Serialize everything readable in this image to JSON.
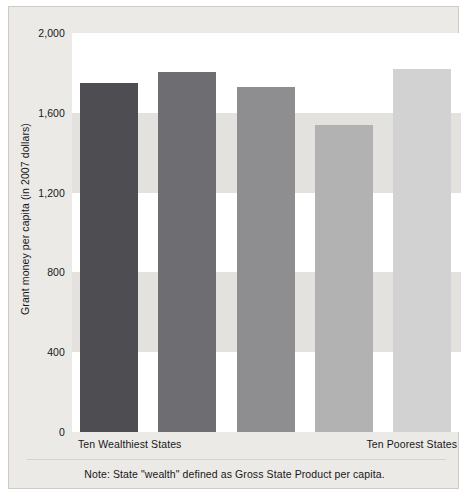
{
  "chart_data": {
    "type": "bar",
    "title": "",
    "xlabel": "",
    "ylabel": "Grant money per capita (in 2007 dollars)",
    "ylim": [
      0,
      2000
    ],
    "yticks": [
      2000,
      1600,
      1200,
      800,
      400,
      0
    ],
    "ytick_labels": [
      "2,000",
      "1,600",
      "1,200",
      "800",
      "400",
      "0"
    ],
    "grid": "horizontal-bands",
    "legend": "none",
    "categories": [
      "Ten Wealthiest States",
      "",
      "",
      "",
      "Ten Poorest States"
    ],
    "xtick_labels": [
      "Ten Wealthiest States",
      "Ten Poorest States"
    ],
    "values": [
      1750,
      1805,
      1730,
      1540,
      1820
    ],
    "bars": [
      {
        "label": "Ten Wealthiest States",
        "value": 1750,
        "color": "#4e4e52"
      },
      {
        "label": "",
        "value": 1805,
        "color": "#6e6e72"
      },
      {
        "label": "",
        "value": 1730,
        "color": "#8e8e90"
      },
      {
        "label": "",
        "value": 1540,
        "color": "#b2b2b2"
      },
      {
        "label": "Ten Poorest States",
        "value": 1820,
        "color": "#d2d2d2"
      }
    ],
    "annotations": [
      "Note: State \"wealth\" defined as Gross State Product per capita."
    ]
  },
  "axis": {
    "y_title": "Grant money per capita (in 2007 dollars)",
    "ticks": [
      {
        "label": "2,000",
        "value": 2000
      },
      {
        "label": "1,600",
        "value": 1600
      },
      {
        "label": "1,200",
        "value": 1200
      },
      {
        "label": "800",
        "value": 800
      },
      {
        "label": "400",
        "value": 400
      },
      {
        "label": "0",
        "value": 0
      }
    ],
    "x_left_label": "Ten Wealthiest States",
    "x_right_label": "Ten Poorest States"
  },
  "note": {
    "text": "Note: State \"wealth\" defined as Gross State Product per capita."
  },
  "colors": {
    "page_background": "#ffffff",
    "panel_background": "#eceae6",
    "panel_border": "#cfcbc4",
    "plot_background": "#ffffff",
    "band": "#e4e2de",
    "text": "#17161a"
  }
}
